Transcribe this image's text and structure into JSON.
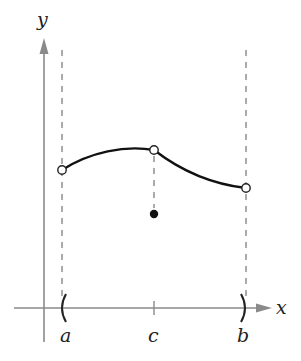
{
  "diagram": {
    "title": "",
    "axes": {
      "x_label": "x",
      "y_label": "y",
      "axis_color": "#8a8a8a"
    },
    "interval": {
      "left_label": "a",
      "right_label": "b",
      "left_bracket": "(",
      "right_bracket": ")",
      "type": "open"
    },
    "tick_label": "c",
    "curve": {
      "color": "#111111",
      "left_endpoint": "open",
      "peak_at_c": "open",
      "right_endpoint": "open"
    },
    "point_at_c": {
      "type": "filled",
      "position": "below curve"
    },
    "dashed_line_color": "#888888"
  }
}
